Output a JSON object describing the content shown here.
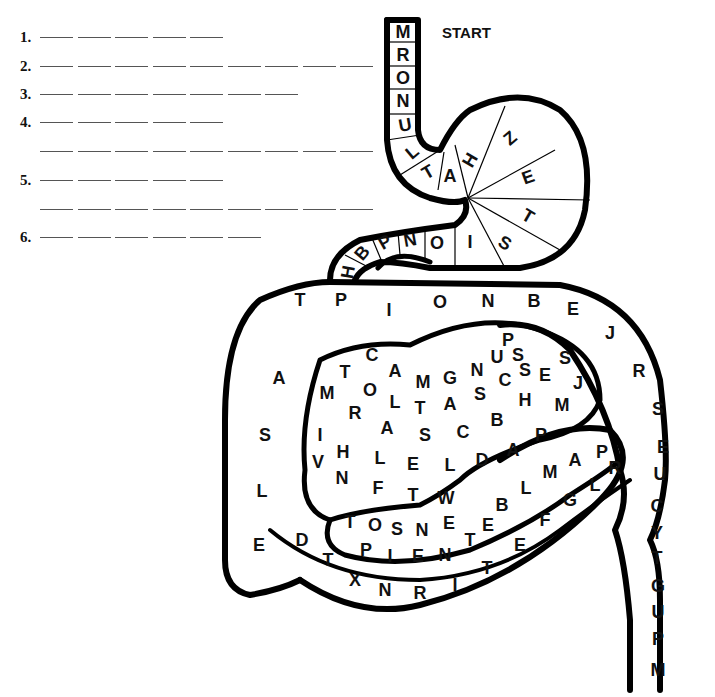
{
  "puzzle": {
    "start_label": "START",
    "answer_rows": [
      {
        "number": "1.",
        "blanks": 5,
        "continuation_blanks": 0
      },
      {
        "number": "2.",
        "blanks": 9,
        "continuation_blanks": 0
      },
      {
        "number": "3.",
        "blanks": 7,
        "continuation_blanks": 0
      },
      {
        "number": "4.",
        "blanks": 5,
        "continuation_blanks": 9
      },
      {
        "number": "5.",
        "blanks": 5,
        "continuation_blanks": 9
      },
      {
        "number": "6.",
        "blanks": 6,
        "continuation_blanks": 0
      }
    ],
    "tract_sections": {
      "esophagus": [
        "M",
        "R",
        "O",
        "N",
        "U",
        "L",
        "T",
        "A"
      ],
      "stomach": [
        "H",
        "Z",
        "E",
        "T",
        "S",
        "I",
        "O",
        "N",
        "P",
        "B",
        "H"
      ],
      "large_intestine_top": [
        "T",
        "P",
        "I",
        "O",
        "N",
        "B",
        "E",
        "J",
        "R",
        "S"
      ],
      "large_intestine_left": [
        "A",
        "S",
        "L",
        "E"
      ],
      "rectum": [
        "E",
        "U",
        "C",
        "Y",
        "T",
        "G",
        "U",
        "P",
        "M"
      ],
      "bottom_loop": [
        "D",
        "T",
        "X",
        "N",
        "R",
        "I",
        "T",
        "E",
        "F",
        "G",
        "L",
        "R"
      ],
      "small_intestine_row1": [
        "C",
        "A",
        "M",
        "G",
        "N",
        "U",
        "P",
        "S"
      ],
      "small_intestine_row2": [
        "T",
        "O",
        "L",
        "T",
        "A",
        "S",
        "C",
        "S",
        "E",
        "S",
        "J"
      ],
      "small_intestine_row3": [
        "M",
        "R",
        "A",
        "S",
        "C",
        "B",
        "H",
        "M"
      ],
      "small_intestine_row4": [
        "I",
        "H",
        "L",
        "E",
        "L",
        "D",
        "A",
        "P"
      ],
      "small_intestine_row5": [
        "V",
        "N",
        "F",
        "T",
        "W"
      ],
      "small_intestine_row6": [
        "T",
        "O",
        "S",
        "N",
        "E",
        "B",
        "L",
        "M",
        "A",
        "P"
      ],
      "small_intestine_row7": [
        "P",
        "I",
        "E",
        "N",
        "T",
        "E"
      ]
    }
  }
}
